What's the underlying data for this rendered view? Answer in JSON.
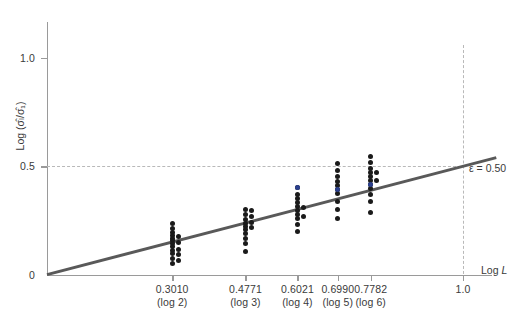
{
  "chart_data": {
    "type": "scatter",
    "title": "",
    "subtitle": "",
    "xlabel": "Log L",
    "ylabel": "Log (σ̂ₗ/σ̂₁)",
    "xlim": [
      0,
      1.08
    ],
    "ylim": [
      0,
      1.18
    ],
    "grid": false,
    "legend": null,
    "x_ticks": [
      {
        "value": 0.301,
        "label": "0.3010",
        "sublabel": "(log 2)"
      },
      {
        "value": 0.4771,
        "label": "0.4771",
        "sublabel": "(log 3)"
      },
      {
        "value": 0.6021,
        "label": "0.6021",
        "sublabel": "(log 4)"
      },
      {
        "value": 0.699,
        "label": "0.6990",
        "sublabel": "(log 5)"
      },
      {
        "value": 0.7782,
        "label": "0.7782",
        "sublabel": "(log 6)"
      },
      {
        "value": 1.0,
        "label": "1.0",
        "sublabel": ""
      }
    ],
    "y_ticks": [
      {
        "value": 0.0,
        "label": "0"
      },
      {
        "value": 0.5,
        "label": "0.5"
      },
      {
        "value": 1.0,
        "label": "1.0"
      }
    ],
    "reference_lines": [
      {
        "name": "epsilon-line",
        "orientation": "horizontal",
        "value": 0.5,
        "style": "dashed",
        "color": "#b9b9b9"
      },
      {
        "name": "log-l-one-line",
        "orientation": "vertical",
        "value": 1.0,
        "style": "dashed",
        "color": "#b9b9b9"
      }
    ],
    "annotations": [
      {
        "name": "epsilon-annotation",
        "text": "ε = 0.50",
        "symbol": "ε",
        "value": "0.50",
        "x": 1.0,
        "y": 0.5
      }
    ],
    "fit_line": {
      "name": "regression-line",
      "slope": 0.5,
      "intercept": 0.0,
      "color": "#595959",
      "x_start": 0.0,
      "y_start": 0.0,
      "x_end": 1.08,
      "y_end": 0.54
    },
    "series": [
      {
        "name": "observations",
        "color": "#1a1a1a",
        "points": [
          {
            "x": 0.301,
            "y": 0.236
          },
          {
            "x": 0.301,
            "y": 0.214
          },
          {
            "x": 0.301,
            "y": 0.196
          },
          {
            "x": 0.301,
            "y": 0.182
          },
          {
            "x": 0.301,
            "y": 0.168
          },
          {
            "x": 0.301,
            "y": 0.156
          },
          {
            "x": 0.301,
            "y": 0.142
          },
          {
            "x": 0.301,
            "y": 0.128
          },
          {
            "x": 0.301,
            "y": 0.112
          },
          {
            "x": 0.301,
            "y": 0.098
          },
          {
            "x": 0.301,
            "y": 0.074
          },
          {
            "x": 0.301,
            "y": 0.052
          },
          {
            "x": 0.3155,
            "y": 0.176
          },
          {
            "x": 0.3155,
            "y": 0.148
          },
          {
            "x": 0.3155,
            "y": 0.118
          },
          {
            "x": 0.3155,
            "y": 0.092
          },
          {
            "x": 0.3155,
            "y": 0.066
          },
          {
            "x": 0.4771,
            "y": 0.3
          },
          {
            "x": 0.4771,
            "y": 0.276
          },
          {
            "x": 0.4771,
            "y": 0.256
          },
          {
            "x": 0.4771,
            "y": 0.238
          },
          {
            "x": 0.4771,
            "y": 0.222
          },
          {
            "x": 0.4771,
            "y": 0.206
          },
          {
            "x": 0.4771,
            "y": 0.188
          },
          {
            "x": 0.4771,
            "y": 0.166
          },
          {
            "x": 0.4771,
            "y": 0.142
          },
          {
            "x": 0.4771,
            "y": 0.108
          },
          {
            "x": 0.4916,
            "y": 0.294
          },
          {
            "x": 0.4916,
            "y": 0.268
          },
          {
            "x": 0.4916,
            "y": 0.242
          },
          {
            "x": 0.4916,
            "y": 0.216
          },
          {
            "x": 0.6021,
            "y": 0.402
          },
          {
            "x": 0.6021,
            "y": 0.372
          },
          {
            "x": 0.6021,
            "y": 0.35
          },
          {
            "x": 0.6021,
            "y": 0.332
          },
          {
            "x": 0.6021,
            "y": 0.314
          },
          {
            "x": 0.6021,
            "y": 0.296
          },
          {
            "x": 0.6021,
            "y": 0.278
          },
          {
            "x": 0.6021,
            "y": 0.258
          },
          {
            "x": 0.6021,
            "y": 0.23
          },
          {
            "x": 0.6021,
            "y": 0.198
          },
          {
            "x": 0.6166,
            "y": 0.31
          },
          {
            "x": 0.6166,
            "y": 0.266
          },
          {
            "x": 0.699,
            "y": 0.512
          },
          {
            "x": 0.699,
            "y": 0.48
          },
          {
            "x": 0.699,
            "y": 0.454
          },
          {
            "x": 0.699,
            "y": 0.432
          },
          {
            "x": 0.699,
            "y": 0.412
          },
          {
            "x": 0.699,
            "y": 0.394
          },
          {
            "x": 0.699,
            "y": 0.374
          },
          {
            "x": 0.699,
            "y": 0.336
          },
          {
            "x": 0.699,
            "y": 0.3
          },
          {
            "x": 0.699,
            "y": 0.258
          },
          {
            "x": 0.7782,
            "y": 0.546
          },
          {
            "x": 0.7782,
            "y": 0.516
          },
          {
            "x": 0.7782,
            "y": 0.492
          },
          {
            "x": 0.7782,
            "y": 0.47
          },
          {
            "x": 0.7782,
            "y": 0.452
          },
          {
            "x": 0.7782,
            "y": 0.434
          },
          {
            "x": 0.7782,
            "y": 0.416
          },
          {
            "x": 0.7782,
            "y": 0.396
          },
          {
            "x": 0.7782,
            "y": 0.368
          },
          {
            "x": 0.7782,
            "y": 0.336
          },
          {
            "x": 0.7782,
            "y": 0.286
          },
          {
            "x": 0.793,
            "y": 0.47
          },
          {
            "x": 0.793,
            "y": 0.436
          }
        ]
      },
      {
        "name": "highlighted-observations",
        "color": "#2b3f8c",
        "points": [
          {
            "x": 0.6021,
            "y": 0.402
          },
          {
            "x": 0.699,
            "y": 0.394
          },
          {
            "x": 0.7782,
            "y": 0.416
          }
        ]
      }
    ]
  }
}
